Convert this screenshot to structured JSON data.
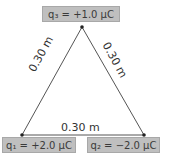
{
  "diagram": {
    "charges": [
      {
        "id": "q1",
        "label": "q₁ = +2.0 μC",
        "position": "bottom-left"
      },
      {
        "id": "q2",
        "label": "q₂ = −2.0 μC",
        "position": "bottom-right"
      },
      {
        "id": "q3",
        "label": "q₃ = +1.0 μC",
        "position": "top"
      }
    ],
    "sides": [
      {
        "between": [
          "q1",
          "q3"
        ],
        "label": "0.30 m"
      },
      {
        "between": [
          "q2",
          "q3"
        ],
        "label": "0.30 m"
      },
      {
        "between": [
          "q1",
          "q2"
        ],
        "label": "0.30 m"
      }
    ],
    "colors": {
      "label_fill": "#bfbfbf",
      "line": "#444444",
      "vertex": "#222222"
    }
  }
}
